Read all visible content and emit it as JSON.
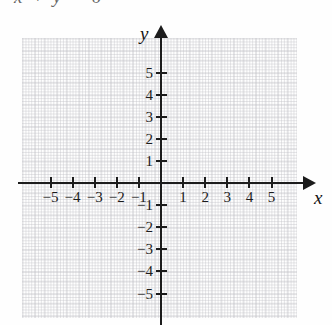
{
  "figure": {
    "type": "coordinate-plane",
    "clipped_caption": "x + y = 6",
    "axis_labels": {
      "x": "x",
      "y": "y"
    },
    "axis_arrows": {
      "x_positive": true,
      "y_positive": true,
      "x_negative": false,
      "y_negative": false
    },
    "colors": {
      "axis": "#1c1c1c",
      "grid": "#8c8c96",
      "text": "#1b1b1b",
      "background": "#fefefe"
    }
  },
  "chart_data": {
    "type": "scatter",
    "title": "",
    "subtitle": "",
    "xlabel": "x",
    "ylabel": "y",
    "xlim": [
      -6,
      6
    ],
    "ylim": [
      -6,
      6
    ],
    "grid": true,
    "legend": null,
    "legend_position": "none",
    "x_ticks": [
      -5,
      -4,
      -3,
      -2,
      -1,
      1,
      2,
      3,
      4,
      5
    ],
    "y_ticks": [
      5,
      4,
      3,
      2,
      1,
      -1,
      -2,
      -3,
      -4,
      -5
    ],
    "x_tick_labels": [
      "−5",
      "−4",
      "−3",
      "−2",
      "−1",
      "1",
      "2",
      "3",
      "4",
      "5"
    ],
    "y_tick_labels": [
      "5",
      "4",
      "3",
      "2",
      "1",
      "−1",
      "−2",
      "−3",
      "−4",
      "−5"
    ],
    "series": [],
    "annotations": []
  }
}
